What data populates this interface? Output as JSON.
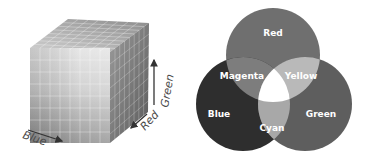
{
  "cube": {
    "axes": {
      "blue": "Blue",
      "red": "Red",
      "green": "Green"
    }
  },
  "venn": {
    "circles": {
      "red": "Red",
      "blue": "Blue",
      "green": "Green"
    },
    "overlaps": {
      "magenta": "Magenta",
      "yellow": "Yellow",
      "cyan": "Cyan"
    },
    "colors": {
      "red": "#6f6f6f",
      "blue": "#2e2e2e",
      "green": "#5e5e5e",
      "magenta": "#7d7d7d",
      "yellow": "#b9b9b9",
      "cyan": "#a8a8a8",
      "white": "#ffffff"
    }
  }
}
